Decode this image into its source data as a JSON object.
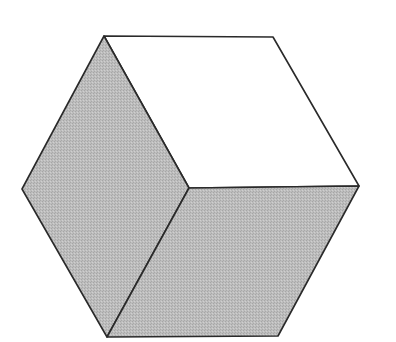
{
  "diagram": {
    "type": "isometric-cube",
    "colors": {
      "background": "#ffffff",
      "shaded_face": "#b9b9b9",
      "light_face": "#ffffff",
      "edge": "#2a2a2a"
    },
    "faces": [
      {
        "name": "top-right-face",
        "fill": "light",
        "points": "104,36 273,37 359,186 189,188"
      },
      {
        "name": "left-face",
        "fill": "shaded",
        "points": "104,36 189,188 107,337 22,189"
      },
      {
        "name": "bottom-face",
        "fill": "shaded",
        "points": "189,188 359,186 278,336 107,337"
      }
    ]
  }
}
